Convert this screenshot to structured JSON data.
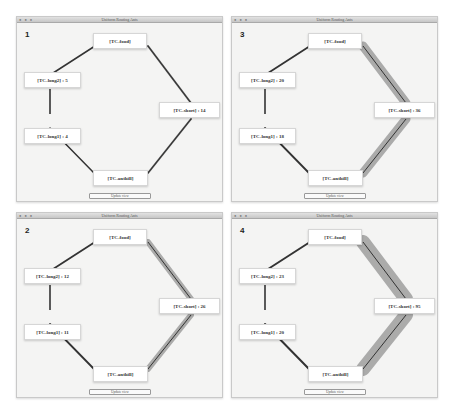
{
  "window_title": "Uniform Routing Ants",
  "update_button": "Update view",
  "panels": [
    {
      "id": "1",
      "food": "[TC-food]",
      "long2": "[TC-long2] : 5",
      "short": "[TC-short] : 14",
      "long1": "[TC-long1] : 4",
      "anthill": "[TC-anthill]"
    },
    {
      "id": "3",
      "food": "[TC-food]",
      "long2": "[TC-long2] : 20",
      "short": "[TC-short] : 36",
      "long1": "[TC-long1] : 18",
      "anthill": "[TC-anthill]"
    },
    {
      "id": "2",
      "food": "[TC-food]",
      "long2": "[TC-long2] : 12",
      "short": "[TC-short] : 26",
      "long1": "[TC-long1] : 11",
      "anthill": "[TC-anthill]"
    },
    {
      "id": "4",
      "food": "[TC-food]",
      "long2": "[TC-long2] : 23",
      "short": "[TC-short] : 95",
      "long1": "[TC-long1] : 20",
      "anthill": "[TC-anthill]"
    }
  ],
  "edge_widths": [
    [
      1.5,
      2,
      2,
      1.5
    ],
    [
      1.8,
      9,
      9,
      1.8
    ],
    [
      1.8,
      6,
      6,
      1.8
    ],
    [
      2,
      14,
      14,
      2
    ]
  ]
}
